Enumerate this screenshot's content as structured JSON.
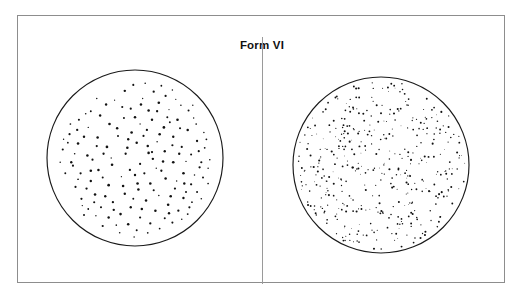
{
  "figure": {
    "title": "Form VI",
    "frame": {
      "x": 17,
      "y": 15,
      "width": 488,
      "height": 268,
      "border_color": "#8d8d8d",
      "background_color": "#ffffff"
    },
    "divider": {
      "orientation": "vertical",
      "x": 262,
      "y_top": 36,
      "y_bottom": 283,
      "color": "#9a9a9a"
    },
    "dot_color": "#121212",
    "outline_color": "#1a1a1a"
  },
  "chart_data": {
    "type": "scatter",
    "title": "Form VI",
    "subtitle": "",
    "xlabel": "",
    "ylabel": "",
    "grid": false,
    "legend": "none",
    "panels": [
      {
        "name": "left-stipple-field",
        "label": "",
        "shape": "circle",
        "center_x": 134,
        "center_y": 157,
        "radius": 88,
        "dot_count": 168,
        "dot_size_range_px": [
          1.1,
          2.9
        ],
        "dot_mean_size_px": 2.1,
        "density_relative": "low",
        "points": [
          [
            0.07,
            -0.63,
            2.5
          ],
          [
            0.22,
            -0.78,
            2.3
          ],
          [
            -0.12,
            -0.79,
            2.4
          ],
          [
            0.36,
            -0.73,
            2.2
          ],
          [
            -0.34,
            -0.63,
            2.4
          ],
          [
            0.54,
            -0.62,
            1.6
          ],
          [
            0.44,
            -0.8,
            1.5
          ],
          [
            -0.52,
            -0.55,
            1.9
          ],
          [
            0.09,
            -0.7,
            1.3
          ],
          [
            0.28,
            -0.65,
            2.6
          ],
          [
            -0.24,
            -0.68,
            1.2
          ],
          [
            0.63,
            -0.56,
            2.0
          ],
          [
            0.16,
            -0.56,
            2.5
          ],
          [
            -0.05,
            -0.58,
            2.2
          ],
          [
            0.4,
            -0.57,
            1.2
          ],
          [
            -0.41,
            -0.5,
            2.4
          ],
          [
            -0.66,
            -0.45,
            2.1
          ],
          [
            0.72,
            -0.4,
            1.7
          ],
          [
            0.5,
            -0.45,
            2.6
          ],
          [
            0.2,
            -0.45,
            2.4
          ],
          [
            -0.13,
            -0.47,
            2.0
          ],
          [
            -0.3,
            -0.4,
            2.6
          ],
          [
            0.06,
            -0.4,
            1.3
          ],
          [
            0.34,
            -0.36,
            2.7
          ],
          [
            0.62,
            -0.33,
            2.5
          ],
          [
            -0.55,
            -0.36,
            1.4
          ],
          [
            -0.77,
            -0.28,
            2.2
          ],
          [
            0.84,
            -0.22,
            1.8
          ],
          [
            0.14,
            -0.33,
            2.3
          ],
          [
            -0.04,
            -0.3,
            2.6
          ],
          [
            0.45,
            -0.25,
            2.4
          ],
          [
            -0.2,
            -0.26,
            2.0
          ],
          [
            -0.44,
            -0.24,
            2.5
          ],
          [
            0.73,
            -0.2,
            2.3
          ],
          [
            0.26,
            -0.19,
            1.5
          ],
          [
            -0.67,
            -0.17,
            2.6
          ],
          [
            0.02,
            -0.18,
            2.5
          ],
          [
            0.55,
            -0.13,
            2.2
          ],
          [
            -0.33,
            -0.13,
            2.7
          ],
          [
            -0.85,
            -0.1,
            2.1
          ],
          [
            0.35,
            -0.08,
            2.4
          ],
          [
            0.16,
            -0.06,
            2.6
          ],
          [
            -0.11,
            -0.05,
            2.3
          ],
          [
            0.66,
            -0.04,
            2.0
          ],
          [
            -0.56,
            -0.03,
            2.5
          ],
          [
            0.88,
            0.02,
            1.6
          ],
          [
            -0.75,
            0.05,
            2.4
          ],
          [
            0.45,
            0.05,
            2.7
          ],
          [
            0.06,
            0.07,
            2.2
          ],
          [
            -0.27,
            0.08,
            2.6
          ],
          [
            0.25,
            0.12,
            1.4
          ],
          [
            0.76,
            0.11,
            2.3
          ],
          [
            -0.43,
            0.14,
            2.5
          ],
          [
            -0.64,
            0.18,
            2.2
          ],
          [
            0.57,
            0.18,
            2.6
          ],
          [
            0.0,
            0.2,
            2.4
          ],
          [
            -0.16,
            0.22,
            1.3
          ],
          [
            0.36,
            0.24,
            2.5
          ],
          [
            0.8,
            0.23,
            2.0
          ],
          [
            -0.52,
            0.27,
            2.4
          ],
          [
            -0.82,
            0.18,
            1.9
          ],
          [
            0.18,
            0.3,
            2.6
          ],
          [
            0.66,
            0.31,
            2.3
          ],
          [
            -0.31,
            0.32,
            2.7
          ],
          [
            0.47,
            0.36,
            2.2
          ],
          [
            -0.7,
            0.34,
            2.1
          ],
          [
            0.04,
            0.37,
            2.5
          ],
          [
            -0.12,
            0.42,
            2.4
          ],
          [
            0.28,
            0.44,
            1.5
          ],
          [
            0.73,
            0.4,
            2.0
          ],
          [
            -0.47,
            0.43,
            2.6
          ],
          [
            0.57,
            0.47,
            2.4
          ],
          [
            -0.63,
            0.48,
            2.2
          ],
          [
            0.13,
            0.5,
            2.5
          ],
          [
            -0.26,
            0.52,
            2.3
          ],
          [
            0.39,
            0.55,
            2.6
          ],
          [
            0.67,
            0.52,
            1.7
          ],
          [
            -0.05,
            0.58,
            2.4
          ],
          [
            -0.4,
            0.58,
            2.1
          ],
          [
            0.24,
            0.62,
            2.5
          ],
          [
            -0.55,
            0.6,
            1.8
          ],
          [
            0.51,
            0.62,
            2.3
          ],
          [
            -0.17,
            0.66,
            2.6
          ],
          [
            0.06,
            0.7,
            2.2
          ],
          [
            0.35,
            0.71,
            2.0
          ],
          [
            -0.31,
            0.7,
            2.4
          ],
          [
            -0.46,
            0.68,
            1.4
          ],
          [
            0.62,
            0.66,
            1.9
          ],
          [
            0.18,
            0.77,
            2.3
          ],
          [
            -0.08,
            0.78,
            2.5
          ],
          [
            -0.22,
            0.79,
            1.6
          ],
          [
            0.44,
            0.76,
            2.1
          ],
          [
            0.29,
            0.83,
            1.8
          ],
          [
            0.02,
            0.85,
            2.0
          ],
          [
            -0.38,
            0.8,
            2.2
          ],
          [
            0.55,
            0.72,
            1.5
          ],
          [
            -0.6,
            0.67,
            2.0
          ],
          [
            0.78,
            0.48,
            1.6
          ],
          [
            0.86,
            0.3,
            1.7
          ],
          [
            -0.88,
            0.05,
            1.5
          ],
          [
            -0.79,
            -0.18,
            1.8
          ],
          [
            0.69,
            -0.47,
            1.4
          ],
          [
            -0.58,
            -0.52,
            1.6
          ],
          [
            0.31,
            -0.85,
            1.8
          ],
          [
            -0.45,
            -0.7,
            1.5
          ],
          [
            0.12,
            -0.88,
            1.6
          ],
          [
            -0.02,
            -0.86,
            2.1
          ],
          [
            0.48,
            -0.69,
            1.3
          ],
          [
            -0.68,
            -0.33,
            2.3
          ],
          [
            0.81,
            -0.3,
            1.5
          ],
          [
            -0.09,
            -0.12,
            2.6
          ],
          [
            0.1,
            -0.26,
            2.1
          ],
          [
            -0.37,
            -0.05,
            2.3
          ],
          [
            0.41,
            -0.42,
            1.9
          ],
          [
            0.21,
            0.01,
            2.4
          ],
          [
            -0.21,
            -0.35,
            2.5
          ],
          [
            0.6,
            0.04,
            1.4
          ],
          [
            -0.5,
            0.02,
            2.2
          ],
          [
            0.03,
            0.3,
            2.6
          ],
          [
            -0.38,
            0.23,
            2.0
          ],
          [
            0.31,
            0.15,
            2.3
          ],
          [
            0.7,
            0.2,
            1.5
          ],
          [
            -0.73,
            0.09,
            2.1
          ],
          [
            0.15,
            -0.14,
            2.5
          ],
          [
            0.52,
            -0.05,
            2.4
          ],
          [
            -0.28,
            0.0,
            1.3
          ],
          [
            0.42,
            0.45,
            2.6
          ],
          [
            -0.02,
            0.48,
            1.9
          ],
          [
            -0.57,
            0.36,
            2.3
          ],
          [
            0.22,
            0.38,
            2.1
          ],
          [
            0.78,
            0.05,
            2.2
          ],
          [
            -0.67,
            0.25,
            1.7
          ],
          [
            0.08,
            0.6,
            2.5
          ],
          [
            -0.35,
            0.45,
            2.4
          ],
          [
            0.64,
            0.58,
            2.2
          ],
          [
            -0.14,
            0.33,
            2.6
          ],
          [
            0.49,
            0.27,
            1.4
          ],
          [
            -0.48,
            0.52,
            2.1
          ],
          [
            0.33,
            0.04,
            2.5
          ],
          [
            -0.06,
            0.14,
            2.3
          ],
          [
            0.6,
            0.4,
            2.0
          ],
          [
            -0.25,
            0.61,
            2.4
          ],
          [
            0.44,
            -0.15,
            2.2
          ],
          [
            -0.71,
            -0.05,
            1.6
          ],
          [
            0.86,
            0.12,
            1.5
          ],
          [
            0.26,
            -0.55,
            2.3
          ],
          [
            -0.15,
            -0.6,
            2.1
          ],
          [
            0.68,
            -0.62,
            1.4
          ],
          [
            -0.76,
            -0.4,
            1.7
          ],
          [
            0.0,
            -0.48,
            2.5
          ],
          [
            0.38,
            -0.48,
            2.0
          ],
          [
            -0.6,
            -0.25,
            2.4
          ],
          [
            0.75,
            -0.08,
            2.2
          ],
          [
            -0.01,
            0.93,
            1.5
          ],
          [
            0.15,
            0.88,
            1.7
          ],
          [
            -0.18,
            0.88,
            1.6
          ],
          [
            0.4,
            0.65,
            2.4
          ],
          [
            -0.52,
            0.15,
            2.6
          ],
          [
            0.53,
            -0.35,
            2.1
          ],
          [
            -0.08,
            -0.22,
            2.4
          ],
          [
            0.29,
            -0.28,
            2.6
          ],
          [
            -0.62,
            0.56,
            1.4
          ],
          [
            0.11,
            0.18,
            2.2
          ],
          [
            0.82,
            -0.12,
            1.8
          ],
          [
            -0.84,
            -0.22,
            1.4
          ],
          [
            0.2,
            -0.07,
            2.3
          ],
          [
            -0.45,
            -0.14,
            2.2
          ],
          [
            0.58,
            0.3,
            2.4
          ]
        ]
      },
      {
        "name": "right-stipple-field",
        "label": "",
        "shape": "circle",
        "center_x": 380,
        "center_y": 164,
        "radius": 88,
        "dot_count": 430,
        "dot_size_range_px": [
          0.8,
          2.1
        ],
        "dot_mean_size_px": 1.5,
        "density_relative": "high",
        "seed": 77
      }
    ]
  }
}
